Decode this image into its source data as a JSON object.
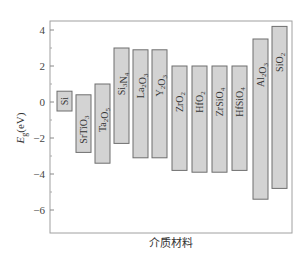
{
  "chart_data": {
    "type": "bar",
    "subtype": "floating-range-bar",
    "title": "",
    "xlabel": "介质材料",
    "ylabel": "E_g(eV)",
    "ylabel_main": "E",
    "ylabel_sub": "g",
    "ylabel_unit": "(eV)",
    "ylim": [
      -7.2,
      4.5
    ],
    "yticks": [
      4,
      2,
      0,
      -2,
      -4,
      -6
    ],
    "ytick_labels": [
      "4",
      "2",
      "0",
      "−2",
      "−4",
      "−6"
    ],
    "grid": false,
    "legend": null,
    "categories": [
      "Si",
      "SrTiO3",
      "Ta2O5",
      "Si3N4",
      "La2O3",
      "Y2O3",
      "ZrO2",
      "HfO2",
      "ZrSiO4",
      "HfSiO4",
      "Al2O3",
      "SiO2"
    ],
    "bars": [
      {
        "label_main": "Si",
        "label_parts": [
          [
            "Si",
            ""
          ]
        ],
        "top": 0.6,
        "bottom": -0.5
      },
      {
        "label_main": "SrTiO3",
        "label_parts": [
          [
            "SrTiO",
            "3"
          ]
        ],
        "top": 0.4,
        "bottom": -2.8
      },
      {
        "label_main": "Ta2O5",
        "label_parts": [
          [
            "Ta",
            "2"
          ],
          [
            "O",
            "5"
          ]
        ],
        "top": 1.0,
        "bottom": -3.4
      },
      {
        "label_main": "Si3N4",
        "label_parts": [
          [
            "Si",
            "3"
          ],
          [
            "N",
            "4"
          ]
        ],
        "top": 3.0,
        "bottom": -2.3
      },
      {
        "label_main": "La2O3",
        "label_parts": [
          [
            "La",
            "2"
          ],
          [
            "O",
            "3"
          ]
        ],
        "top": 2.9,
        "bottom": -3.1
      },
      {
        "label_main": "Y2O3",
        "label_parts": [
          [
            "Y",
            "2"
          ],
          [
            "O",
            "3"
          ]
        ],
        "top": 2.9,
        "bottom": -3.1
      },
      {
        "label_main": "ZrO2",
        "label_parts": [
          [
            "ZrO",
            "2"
          ]
        ],
        "top": 2.0,
        "bottom": -3.8
      },
      {
        "label_main": "HfO2",
        "label_parts": [
          [
            "HfO",
            "2"
          ]
        ],
        "top": 2.0,
        "bottom": -3.9
      },
      {
        "label_main": "ZrSiO4",
        "label_parts": [
          [
            "ZrSiO",
            "4"
          ]
        ],
        "top": 2.0,
        "bottom": -3.9
      },
      {
        "label_main": "HfSiO4",
        "label_parts": [
          [
            "HfSiO",
            "4"
          ]
        ],
        "top": 2.0,
        "bottom": -3.8
      },
      {
        "label_main": "Al2O3",
        "label_parts": [
          [
            "Al",
            "2"
          ],
          [
            "O",
            "3"
          ]
        ],
        "top": 3.5,
        "bottom": -5.4
      },
      {
        "label_main": "SiO2",
        "label_parts": [
          [
            "SiO",
            "2"
          ]
        ],
        "top": 4.2,
        "bottom": -4.8
      }
    ],
    "colors": {
      "bar_fill": "#d3d3d3",
      "bar_stroke": "#6e6e6e",
      "axis": "#9a9a9a"
    }
  }
}
